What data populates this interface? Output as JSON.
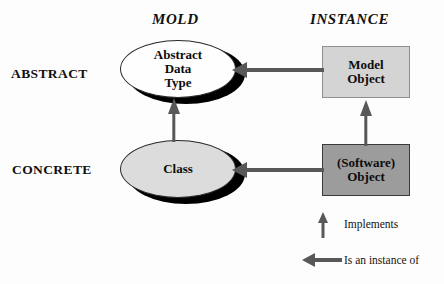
{
  "diagram": {
    "background_color": "#fdfdfd",
    "columns": [
      {
        "id": "mold",
        "label": "MOLD"
      },
      {
        "id": "instance",
        "label": "INSTANCE"
      }
    ],
    "rows": [
      {
        "id": "abstract",
        "label": "ABSTRACT"
      },
      {
        "id": "concrete",
        "label": "CONCRETE"
      }
    ],
    "nodes": [
      {
        "id": "abstract-data-type",
        "label": "Abstract\nData\nType",
        "shape": "ellipse",
        "row": "abstract",
        "column": "mold",
        "fill": "#fefefe",
        "stroke": "#2a2a2a",
        "shadow": "#000000"
      },
      {
        "id": "class",
        "label": "Class",
        "shape": "ellipse",
        "row": "concrete",
        "column": "mold",
        "fill": "#dcdcdc",
        "stroke": "#2a2a2a",
        "shadow": "#000000"
      },
      {
        "id": "model-object",
        "label": "Model\nObject",
        "shape": "rectangle",
        "row": "abstract",
        "column": "instance",
        "fill": "#d4d4d4",
        "stroke": "#8e8e8e"
      },
      {
        "id": "software-object",
        "label": "(Software)\nObject",
        "shape": "rectangle",
        "row": "concrete",
        "column": "instance",
        "fill": "#9c9c9c",
        "stroke": "#3a3a3a"
      }
    ],
    "edges": [
      {
        "id": "model-object-to-abstract-data-type",
        "from": "model-object",
        "to": "abstract-data-type",
        "relation": "Is an instance of",
        "direction": "left",
        "color": "#585858"
      },
      {
        "id": "software-object-to-class",
        "from": "software-object",
        "to": "class",
        "relation": "Is an instance of",
        "direction": "left",
        "color": "#585858"
      },
      {
        "id": "class-to-abstract-data-type",
        "from": "class",
        "to": "abstract-data-type",
        "relation": "Implements",
        "direction": "up",
        "color": "#585858"
      },
      {
        "id": "software-object-to-model-object",
        "from": "software-object",
        "to": "model-object",
        "relation": "Implements",
        "direction": "up",
        "color": "#585858"
      }
    ],
    "legend": [
      {
        "id": "implements",
        "symbol": "up-arrow-icon",
        "label": "Implements"
      },
      {
        "id": "is-an-instance-of",
        "symbol": "left-arrow-icon",
        "label": "Is an instance of"
      }
    ]
  }
}
